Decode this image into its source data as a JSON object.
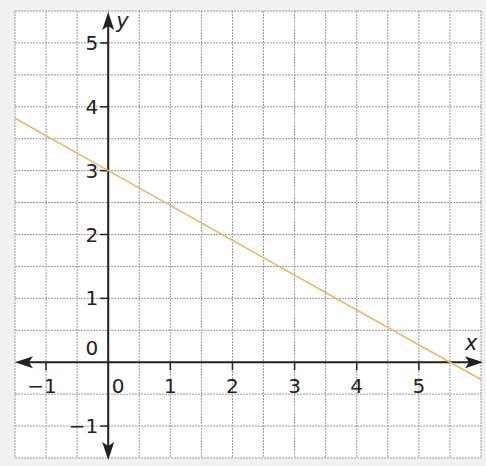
{
  "chart_data": {
    "type": "line",
    "title": "",
    "xlabel": "x",
    "ylabel": "y",
    "xlim": [
      -1.5,
      6
    ],
    "ylim": [
      -1.5,
      5.5
    ],
    "grid": true,
    "grid_step": 0.5,
    "x_ticks": [
      -1,
      0,
      1,
      2,
      3,
      4,
      5
    ],
    "y_ticks": [
      -1,
      0,
      1,
      2,
      3,
      4,
      5
    ],
    "x_tick_labels": [
      "−1",
      "0",
      "1",
      "2",
      "3",
      "4",
      "5"
    ],
    "y_tick_labels": [
      "−1",
      "0",
      "1",
      "2",
      "3",
      "4",
      "5"
    ],
    "series": [
      {
        "name": "line",
        "color": "#e8b86a",
        "equation": "y = 3 - (6/11)x",
        "points": [
          [
            -1.5,
            3.82
          ],
          [
            0,
            3
          ],
          [
            5.5,
            0
          ],
          [
            6,
            -0.27
          ]
        ]
      }
    ],
    "annotations": []
  },
  "colors": {
    "background": "#f1f1f3",
    "plot_background": "#ffffff",
    "grid": "#9a9a9a",
    "axis": "#222222",
    "line": "#e8b86a"
  }
}
